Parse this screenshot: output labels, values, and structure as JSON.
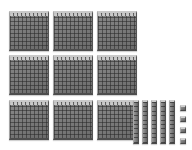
{
  "scene": {
    "title": "Base Ten Blocks",
    "background_color": "#ffffff",
    "width": 192,
    "height": 150
  },
  "palette": {
    "block_face": "#7b7b7b",
    "grid_line": "#282828",
    "top_highlight": "#cccccc",
    "bottom_shadow": "#4d4d4d"
  },
  "groups": [
    {
      "name": "hundreds",
      "piece_label": "hundred-flat",
      "value_each": 100,
      "count": 9,
      "total": 900,
      "rows": 3,
      "columns": 3,
      "cell_grid": "10x10",
      "positions": [
        {
          "x": 9,
          "y": 11
        },
        {
          "x": 53,
          "y": 11
        },
        {
          "x": 97,
          "y": 11
        },
        {
          "x": 9,
          "y": 55
        },
        {
          "x": 53,
          "y": 55
        },
        {
          "x": 97,
          "y": 55
        },
        {
          "x": 9,
          "y": 100
        },
        {
          "x": 53,
          "y": 100
        },
        {
          "x": 97,
          "y": 100
        }
      ]
    },
    {
      "name": "tens",
      "piece_label": "ten-rod",
      "value_each": 10,
      "count": 5,
      "total": 50,
      "cell_grid": "1x10",
      "positions": [
        {
          "x": 133,
          "y": 100
        },
        {
          "x": 142,
          "y": 100
        },
        {
          "x": 151,
          "y": 100
        },
        {
          "x": 160,
          "y": 100
        },
        {
          "x": 169,
          "y": 100
        }
      ]
    },
    {
      "name": "ones",
      "piece_label": "unit-cube",
      "value_each": 1,
      "count": 4,
      "total": 4,
      "cell_grid": "1x1",
      "positions": [
        {
          "x": 180,
          "y": 105
        },
        {
          "x": 180,
          "y": 116
        },
        {
          "x": 180,
          "y": 127
        },
        {
          "x": 180,
          "y": 138
        }
      ]
    }
  ],
  "represented_number": "954",
  "caption": "9 hundreds, 5 tens, 4 ones"
}
